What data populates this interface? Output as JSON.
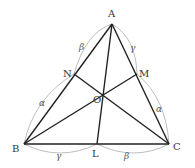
{
  "diagram": {
    "points": {
      "A": {
        "label": "A",
        "x": 112,
        "y": 24
      },
      "B": {
        "label": "B",
        "x": 24,
        "y": 144
      },
      "C": {
        "label": "C",
        "x": 169,
        "y": 144
      },
      "L": {
        "label": "L",
        "x": 97,
        "y": 144
      },
      "M": {
        "label": "M",
        "x": 137,
        "y": 74
      },
      "N": {
        "label": "N",
        "x": 74,
        "y": 74
      },
      "O": {
        "label": "O",
        "x": 103,
        "y": 96
      }
    },
    "segment_labels": {
      "AN": "β",
      "NB": "α",
      "AM": "γ",
      "MC": "α",
      "BL": "γ",
      "LC": "β"
    },
    "colors": {
      "edge": "#222222",
      "arc": "#b5b5b5",
      "label": "#333333"
    }
  }
}
